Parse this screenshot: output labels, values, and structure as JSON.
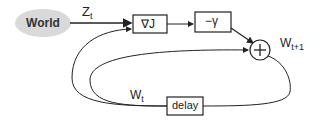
{
  "diagram": {
    "world": {
      "label": "World"
    },
    "signals": {
      "z": {
        "base": "Z",
        "sub": "t"
      },
      "w_next": {
        "base": "W",
        "sub": "t+1"
      },
      "w_curr": {
        "base": "W",
        "sub": "t"
      }
    },
    "blocks": {
      "gradient": {
        "label": "∇J"
      },
      "gain": {
        "label": "−γ"
      },
      "sum": {
        "label": "+"
      },
      "delay": {
        "label": "delay"
      }
    },
    "colors": {
      "stroke": "#222222",
      "cloud_fill": "#d9d9d9",
      "background": "#ffffff"
    }
  }
}
